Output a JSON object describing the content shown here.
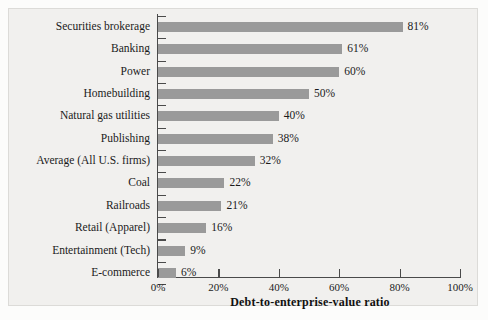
{
  "chart_data": {
    "type": "bar",
    "orientation": "horizontal",
    "title": "",
    "xlabel": "Debt-to-enterprise-value ratio",
    "ylabel": "",
    "xlim": [
      0,
      100
    ],
    "xticks": [
      0,
      20,
      40,
      60,
      80,
      100
    ],
    "xtick_labels": [
      "0%",
      "20%",
      "40%",
      "60%",
      "80%",
      "100%"
    ],
    "grid": false,
    "legend": false,
    "bar_color": "#9a9a9a",
    "value_label_suffix": "%",
    "categories": [
      "Securities brokerage",
      "Banking",
      "Power",
      "Homebuilding",
      "Natural gas utilities",
      "Publishing",
      "Average (All U.S. firms)",
      "Coal",
      "Railroads",
      "Retail (Apparel)",
      "Entertainment (Tech)",
      "E-commerce"
    ],
    "values": [
      81,
      61,
      60,
      50,
      40,
      38,
      32,
      22,
      21,
      16,
      9,
      6
    ],
    "value_labels": [
      "81%",
      "61%",
      "60%",
      "50%",
      "40%",
      "38%",
      "32%",
      "22%",
      "21%",
      "16%",
      "9%",
      "6%"
    ],
    "rows": [
      {
        "label": "Securities brokerage",
        "value": 81,
        "value_label": "81%"
      },
      {
        "label": "Banking",
        "value": 61,
        "value_label": "61%"
      },
      {
        "label": "Power",
        "value": 60,
        "value_label": "60%"
      },
      {
        "label": "Homebuilding",
        "value": 50,
        "value_label": "50%"
      },
      {
        "label": "Natural gas utilities",
        "value": 40,
        "value_label": "40%"
      },
      {
        "label": "Publishing",
        "value": 38,
        "value_label": "38%"
      },
      {
        "label": "Average (All U.S. firms)",
        "value": 32,
        "value_label": "32%"
      },
      {
        "label": "Coal",
        "value": 22,
        "value_label": "22%"
      },
      {
        "label": "Railroads",
        "value": 21,
        "value_label": "21%"
      },
      {
        "label": "Retail (Apparel)",
        "value": 16,
        "value_label": "16%"
      },
      {
        "label": "Entertainment (Tech)",
        "value": 9,
        "value_label": "9%"
      },
      {
        "label": "E-commerce",
        "value": 6,
        "value_label": "6%"
      }
    ]
  }
}
